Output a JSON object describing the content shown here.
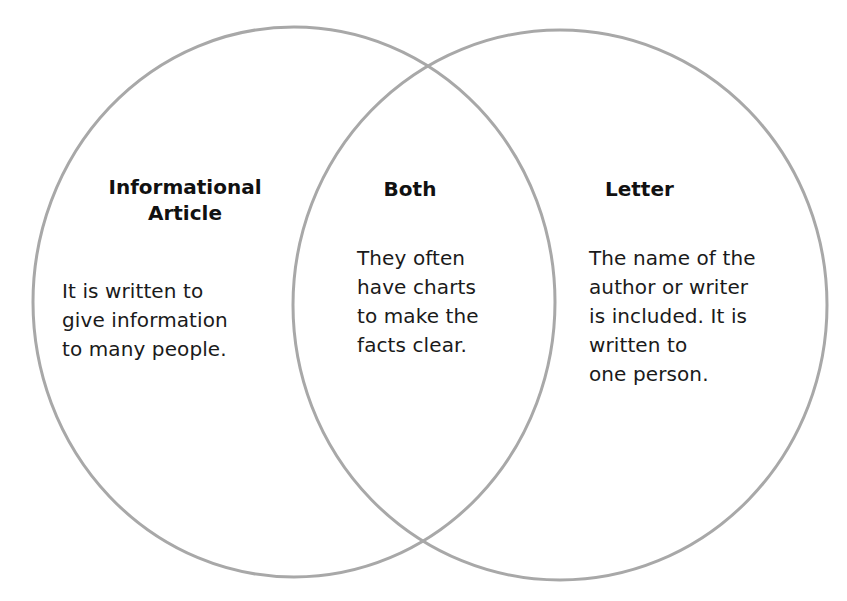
{
  "diagram": {
    "type": "venn",
    "stroke_color": "#a8a8a8",
    "circles": [
      {
        "id": "left",
        "heading": "Informational\nArticle",
        "text": "It is written to\ngive information\nto many people."
      },
      {
        "id": "overlap",
        "heading": "Both",
        "text": "They often\nhave charts\nto make the\nfacts clear."
      },
      {
        "id": "right",
        "heading": "Letter",
        "text": "The name of the\nauthor or writer\nis included. It is\nwritten to\none person."
      }
    ]
  }
}
